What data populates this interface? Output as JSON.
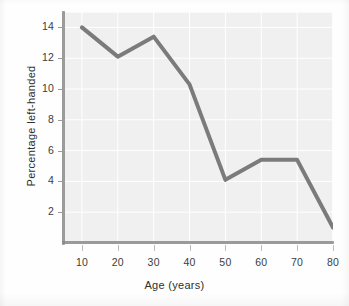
{
  "chart_data": {
    "type": "line",
    "title": "",
    "xlabel": "Age (years)",
    "ylabel": "Percentage left-handed",
    "xlim": [
      5,
      80
    ],
    "ylim": [
      0,
      15
    ],
    "grid": true,
    "legend": false,
    "x": [
      10,
      20,
      30,
      40,
      50,
      60,
      70,
      80
    ],
    "xtick_labels": [
      "10",
      "20",
      "30",
      "40",
      "50",
      "60",
      "70",
      "80"
    ],
    "ytick_labels": [
      "2",
      "4",
      "6",
      "8",
      "10",
      "12",
      "14"
    ],
    "ytick_values": [
      2,
      4,
      6,
      8,
      10,
      12,
      14
    ],
    "series": [
      {
        "name": "Percentage left-handed",
        "values": [
          14.0,
          12.1,
          13.4,
          10.3,
          4.1,
          5.4,
          5.4,
          1.0
        ],
        "color": "#7b7b7b",
        "line_width": 4
      }
    ],
    "colors": {
      "line": "#7b7b7b",
      "plot_background": "#f0f0f0",
      "gridlines": "#ffffff",
      "axis": "#8a8a8a",
      "tick_text": "#3c3c3c",
      "title_text": "#2f2f2f",
      "page_background": "#fefefe"
    }
  }
}
